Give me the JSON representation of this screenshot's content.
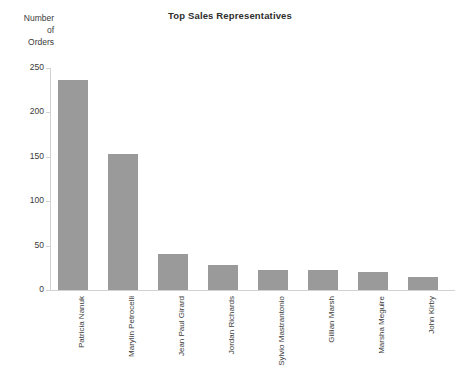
{
  "chart_data": {
    "type": "bar",
    "title": "Top Sales Representatives",
    "xlabel": "",
    "ylabel": "Number of Orders",
    "ylabel_lines": [
      "Number",
      "of",
      "Orders"
    ],
    "categories": [
      "Patricia Nanuk",
      "Marylin Petrocelli",
      "Jean Paul Girard",
      "Jordan Richards",
      "Sylvio Mastrantonio",
      "Gillian Marsh",
      "Marsha Meguire",
      "John Kirby"
    ],
    "values": [
      236,
      153,
      40,
      28,
      23,
      22,
      20,
      15
    ],
    "ylim": [
      0,
      250
    ],
    "yticks": [
      0,
      50,
      100,
      150,
      200,
      250
    ],
    "ytick_labels": [
      "0",
      "50",
      "100",
      "150",
      "200",
      "250"
    ],
    "grid": false,
    "legend": false,
    "bar_color": "#9a9a9a",
    "axis_color": "#d2d2d2",
    "text_color": "#3a3a3a"
  }
}
